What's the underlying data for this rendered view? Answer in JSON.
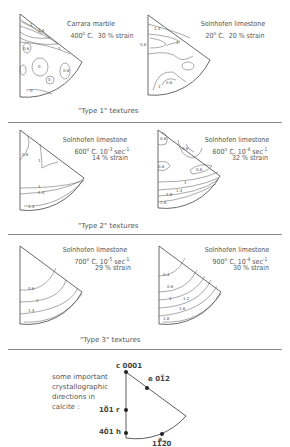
{
  "figure": {
    "groups": [
      {
        "caption": "\"Type 1\"   textures",
        "panels": [
          {
            "material": "Carrara marble",
            "temp": "400",
            "temp_unit": "C.",
            "rate": "",
            "rate_exp": "",
            "strain": "30 % strain",
            "contour_labels": [
              "1",
              "1.4",
              "1",
              "0.6",
              "0",
              "0.6",
              "0",
              "0"
            ]
          },
          {
            "material": "Solnhofen limestone",
            "temp": "20",
            "temp_unit": "C.",
            "rate": "",
            "rate_exp": "",
            "strain": "20 % strain",
            "contour_labels": [
              "1.4",
              "1",
              "0.6",
              "1",
              "0.6"
            ]
          }
        ]
      },
      {
        "caption": "\"Type 2\"   textures",
        "panels": [
          {
            "material": "Solnhofen limestone",
            "temp": "600",
            "temp_unit": "C. 10",
            "rate_exp": "-3",
            "rate_unit": "sec",
            "rate_unit_exp": "-1",
            "strain": "14 % strain",
            "contour_labels": [
              "0.6",
              "1",
              "1",
              "1.4",
              "1.4"
            ]
          },
          {
            "material": "Solnhofen limestone",
            "temp": "600",
            "temp_unit": "C. 10",
            "rate_exp": "-4",
            "rate_unit": "sec",
            "rate_unit_exp": "-1",
            "strain": "32 % strain",
            "contour_labels": [
              "0.6",
              "0.6",
              "0.6",
              "0.6",
              "1",
              "1.4",
              "1.8",
              "1.8"
            ]
          }
        ]
      },
      {
        "caption": "\"Type 3\"   textures",
        "panels": [
          {
            "material": "Solnhofen limestone",
            "temp": "700",
            "temp_unit": "C. 10",
            "rate_exp": "-5",
            "rate_unit": "sec",
            "rate_unit_exp": "-1",
            "strain": "29 % strain",
            "contour_labels": [
              "0.6",
              "1",
              "1.4"
            ]
          },
          {
            "material": "Solnhofen limestone",
            "temp": "900",
            "temp_unit": "C. 10",
            "rate_exp": "-4",
            "rate_unit": "sec",
            "rate_unit_exp": "-1",
            "strain": "30 % strain",
            "contour_labels": [
              "0.4",
              "0.6",
              "1",
              "1.2",
              "1.6",
              "1.8"
            ]
          }
        ]
      }
    ],
    "degree_sign": "o",
    "key": {
      "text_lines": [
        "some important",
        "crystallographic",
        "directions in",
        "calcite :"
      ],
      "directions": [
        {
          "letter": "c",
          "index": "0001"
        },
        {
          "letter": "e",
          "index": "01ī2"
        },
        {
          "letter": "r",
          "index": "10ī1"
        },
        {
          "letter": "h",
          "index": "40Ą41"
        },
        {
          "letter": "a",
          "index": "11Ģ20"
        }
      ],
      "labels": {
        "c": "c  0001",
        "e": "e  01̅2",
        "r": "10̅1  r",
        "h": "40̄1  h",
        "a_letter": "a",
        "a_index": "11̅2̅0"
      }
    }
  }
}
